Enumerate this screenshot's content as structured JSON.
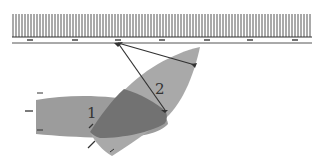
{
  "diagram": {
    "pier": {
      "x_start": 12,
      "x_end": 312,
      "hatch_top": 14,
      "hatch_bottom": 37,
      "edge_y": 42,
      "hatch_spacing": 3,
      "marker_y": 40,
      "markers_x": [
        30,
        75,
        118,
        162,
        207,
        250,
        295
      ]
    },
    "boats": [
      {
        "id": "boat-1",
        "label": "1",
        "label_x": 87,
        "label_y": 118,
        "color": "#9a9a9a"
      },
      {
        "id": "boat-2",
        "label": "2",
        "label_x": 155,
        "label_y": 94,
        "color": "#a8a8a8"
      }
    ],
    "overlap_color": "#6e6e6e",
    "lines": [
      {
        "from": [
          118,
          43
        ],
        "to": [
          195,
          66
        ]
      },
      {
        "from": [
          118,
          43
        ],
        "to": [
          166,
          110
        ]
      }
    ],
    "colors": {
      "ink": "#333333",
      "hatch": "#555555"
    }
  }
}
